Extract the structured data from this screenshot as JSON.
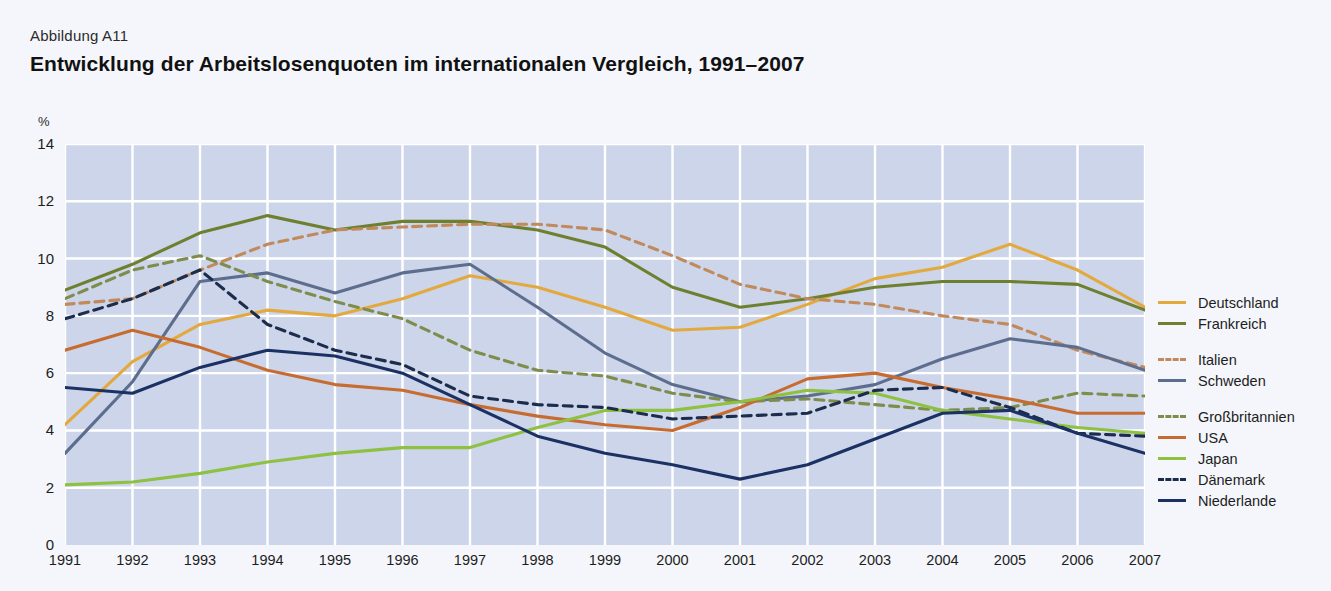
{
  "figure_number": "Abbildung A11",
  "title": "Entwicklung der Arbeitslosenquoten im internationalen Vergleich, 1991–2007",
  "unit": "%",
  "axes": {
    "y_ticks": [
      "14",
      "12",
      "10",
      "8",
      "6",
      "4",
      "2",
      "0"
    ],
    "x_ticks": [
      "1991",
      "1992",
      "1993",
      "1994",
      "1995",
      "1996",
      "1997",
      "1998",
      "1999",
      "2000",
      "2001",
      "2002",
      "2003",
      "2004",
      "2005",
      "2006",
      "2007"
    ]
  },
  "legend": [
    {
      "label": "Deutschland",
      "color": "#e3a93f",
      "style": "solid",
      "group": 0
    },
    {
      "label": "Frankreich",
      "color": "#6e7f30",
      "style": "solid",
      "group": 0
    },
    {
      "label": "Italien",
      "color": "#c18a5c",
      "style": "dashed",
      "group": 1
    },
    {
      "label": "Schweden",
      "color": "#5d6d8e",
      "style": "solid",
      "group": 1
    },
    {
      "label": "Großbritannien",
      "color": "#7f8d4c",
      "style": "dashed",
      "group": 2
    },
    {
      "label": "USA",
      "color": "#c76c30",
      "style": "solid",
      "group": 2
    },
    {
      "label": "Japan",
      "color": "#8ec141",
      "style": "solid",
      "group": 2
    },
    {
      "label": "Dänemark",
      "color": "#1b2c4c",
      "style": "dashed",
      "group": 2
    },
    {
      "label": "Niederlande",
      "color": "#1b3163",
      "style": "solid",
      "group": 2
    }
  ],
  "chart_data": {
    "type": "line",
    "title": "Entwicklung der Arbeitslosenquoten im internationalen Vergleich, 1991–2007",
    "xlabel": "",
    "ylabel": "%",
    "ylim": [
      0,
      14
    ],
    "yticks": [
      0,
      2,
      4,
      6,
      8,
      10,
      12,
      14
    ],
    "grid": true,
    "legend_position": "right",
    "x": [
      1991,
      1992,
      1993,
      1994,
      1995,
      1996,
      1997,
      1998,
      1999,
      2000,
      2001,
      2002,
      2003,
      2004,
      2005,
      2006,
      2007
    ],
    "series": [
      {
        "name": "Deutschland",
        "color": "#e3a93f",
        "style": "solid",
        "values": [
          4.2,
          6.4,
          7.7,
          8.2,
          8.0,
          8.6,
          9.4,
          9.0,
          8.3,
          7.5,
          7.6,
          8.4,
          9.3,
          9.7,
          10.5,
          9.6,
          8.3
        ]
      },
      {
        "name": "Frankreich",
        "color": "#6e7f30",
        "style": "solid",
        "values": [
          8.9,
          9.8,
          10.9,
          11.5,
          11.0,
          11.3,
          11.3,
          11.0,
          10.4,
          9.0,
          8.3,
          8.6,
          9.0,
          9.2,
          9.2,
          9.1,
          8.2
        ]
      },
      {
        "name": "Italien",
        "color": "#c18a5c",
        "style": "dashed",
        "values": [
          8.4,
          8.6,
          9.6,
          10.5,
          11.0,
          11.1,
          11.2,
          11.2,
          11.0,
          10.1,
          9.1,
          8.6,
          8.4,
          8.0,
          7.7,
          6.8,
          6.2
        ]
      },
      {
        "name": "Schweden",
        "color": "#5d6d8e",
        "style": "solid",
        "values": [
          3.2,
          5.7,
          9.2,
          9.5,
          8.8,
          9.5,
          9.8,
          8.3,
          6.7,
          5.6,
          5.0,
          5.2,
          5.6,
          6.5,
          7.2,
          6.9,
          6.1
        ]
      },
      {
        "name": "Großbritannien",
        "color": "#7f8d4c",
        "style": "dashed",
        "values": [
          8.6,
          9.6,
          10.1,
          9.2,
          8.5,
          7.9,
          6.8,
          6.1,
          5.9,
          5.3,
          5.0,
          5.1,
          4.9,
          4.7,
          4.8,
          5.3,
          5.2
        ]
      },
      {
        "name": "USA",
        "color": "#c76c30",
        "style": "solid",
        "values": [
          6.8,
          7.5,
          6.9,
          6.1,
          5.6,
          5.4,
          4.9,
          4.5,
          4.2,
          4.0,
          4.8,
          5.8,
          6.0,
          5.5,
          5.1,
          4.6,
          4.6
        ]
      },
      {
        "name": "Japan",
        "color": "#8ec141",
        "style": "solid",
        "values": [
          2.1,
          2.2,
          2.5,
          2.9,
          3.2,
          3.4,
          3.4,
          4.1,
          4.7,
          4.7,
          5.0,
          5.4,
          5.3,
          4.7,
          4.4,
          4.1,
          3.9
        ]
      },
      {
        "name": "Dänemark",
        "color": "#1b2c4c",
        "style": "dashed",
        "values": [
          7.9,
          8.6,
          9.6,
          7.7,
          6.8,
          6.3,
          5.2,
          4.9,
          4.8,
          4.4,
          4.5,
          4.6,
          5.4,
          5.5,
          4.8,
          3.9,
          3.8
        ]
      },
      {
        "name": "Niederlande",
        "color": "#1b3163",
        "style": "solid",
        "values": [
          5.5,
          5.3,
          6.2,
          6.8,
          6.6,
          6.0,
          4.9,
          3.8,
          3.2,
          2.8,
          2.3,
          2.8,
          3.7,
          4.6,
          4.7,
          3.9,
          3.2
        ]
      }
    ]
  }
}
